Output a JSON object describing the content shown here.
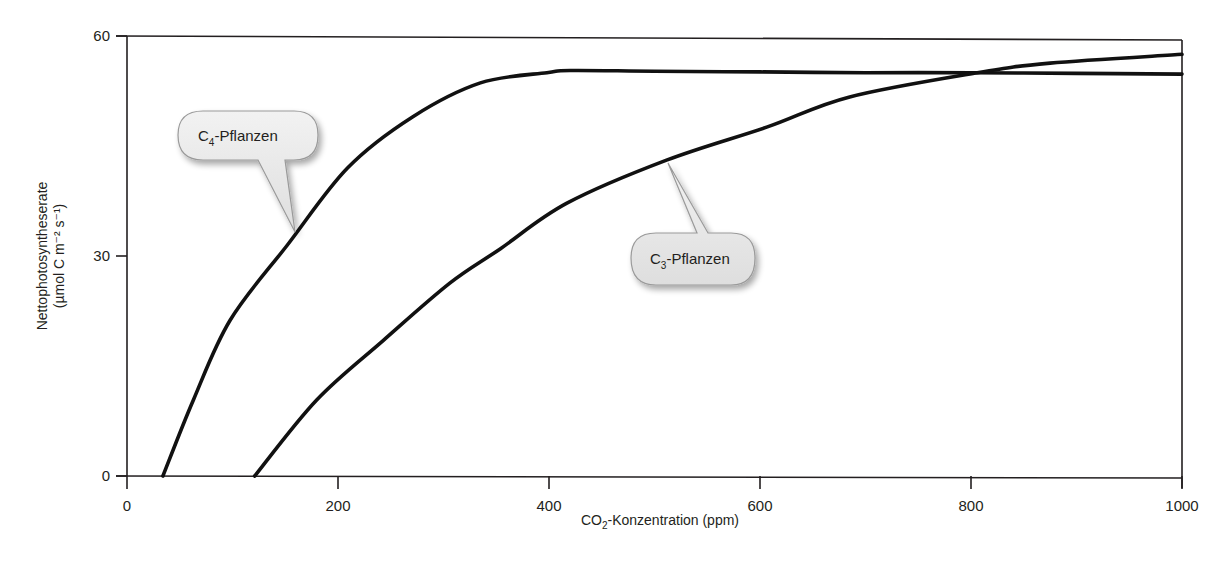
{
  "chart_data": {
    "type": "line",
    "title": "",
    "xlabel": "CO2-Konzentration (ppm)",
    "xlabel_parts": {
      "pre": "CO",
      "sub": "2",
      "post": "-Konzentration (ppm)"
    },
    "ylabel": "Nettophotosyntheserate (µmol C m⁻² s⁻¹)",
    "ylabel_line1": "Nettophotosyntheserate",
    "ylabel_line2": "(µmol C m⁻² s⁻¹)",
    "xlim": [
      0,
      1000
    ],
    "ylim": [
      0,
      60
    ],
    "x_ticks": [
      0,
      200,
      400,
      600,
      800,
      1000
    ],
    "x_tick_labels": [
      "0",
      "200",
      "400",
      "600",
      "800",
      "1000"
    ],
    "y_ticks": [
      0,
      30,
      60
    ],
    "y_tick_labels": [
      "0",
      "30",
      "60"
    ],
    "grid": false,
    "legend": "callout labels on curves",
    "series": [
      {
        "name": "C4-Pflanzen",
        "label_pre": "C",
        "label_sub": "4",
        "label_post": "-Pflanzen",
        "x": [
          34,
          63,
          98,
          152,
          209,
          271,
          335,
          398,
          420,
          500,
          600,
          700,
          800,
          900,
          1000
        ],
        "y": [
          0,
          10.4,
          21.3,
          31.5,
          42,
          49,
          53.6,
          55,
          55.3,
          55.2,
          55.1,
          55.0,
          55.0,
          54.9,
          54.8
        ]
      },
      {
        "name": "C3-Pflanzen",
        "label_pre": "C",
        "label_sub": "3",
        "label_post": "-Pflanzen",
        "x": [
          121,
          180,
          243,
          306,
          354,
          417,
          512,
          607,
          685,
          806,
          875,
          1000
        ],
        "y": [
          0,
          10.4,
          18.5,
          26.3,
          31,
          37.2,
          43.1,
          47.6,
          51.7,
          55,
          56.3,
          57.5
        ]
      }
    ]
  }
}
